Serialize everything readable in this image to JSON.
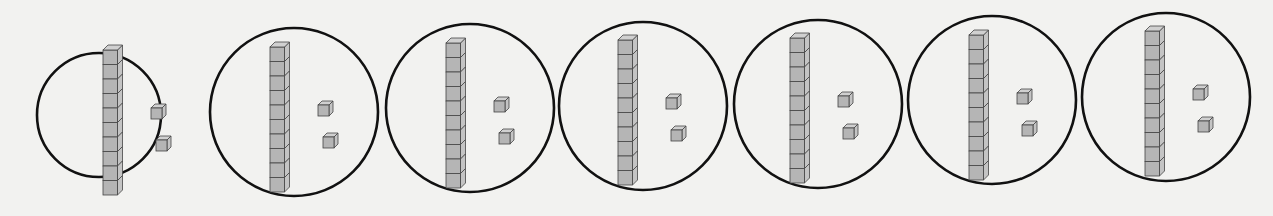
{
  "figure": {
    "group_count": 7,
    "colors": {
      "background": "#f2f2f0",
      "circle_stroke": "#111111",
      "cube_front": "#b5b5b5",
      "cube_top": "#d0d0d0",
      "cube_side": "#c4c4c4",
      "cube_edge": "#444444"
    },
    "groups": [
      {
        "id": 1,
        "cx": 99,
        "cy": 115,
        "r": 62,
        "tens_rods": 1,
        "ones_cubes": 2,
        "rod_x": 103,
        "rod_top": 50
      },
      {
        "id": 2,
        "cx": 294,
        "cy": 112,
        "r": 84,
        "tens_rods": 1,
        "ones_cubes": 2,
        "rod_x": 270,
        "rod_top": 47
      },
      {
        "id": 3,
        "cx": 470,
        "cy": 108,
        "r": 84,
        "tens_rods": 1,
        "ones_cubes": 2,
        "rod_x": 446,
        "rod_top": 43
      },
      {
        "id": 4,
        "cx": 643,
        "cy": 106,
        "r": 84,
        "tens_rods": 1,
        "ones_cubes": 2,
        "rod_x": 618,
        "rod_top": 40
      },
      {
        "id": 5,
        "cx": 818,
        "cy": 104,
        "r": 84,
        "tens_rods": 1,
        "ones_cubes": 2,
        "rod_x": 790,
        "rod_top": 38
      },
      {
        "id": 6,
        "cx": 992,
        "cy": 100,
        "r": 84,
        "tens_rods": 1,
        "ones_cubes": 2,
        "rod_x": 969,
        "rod_top": 35
      },
      {
        "id": 7,
        "cx": 1166,
        "cy": 97,
        "r": 84,
        "tens_rods": 1,
        "ones_cubes": 2,
        "rod_x": 1145,
        "rod_top": 31
      }
    ]
  }
}
